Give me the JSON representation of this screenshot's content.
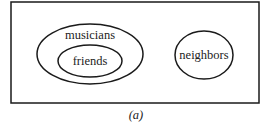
{
  "diagram": {
    "type": "venn-euler",
    "frame": {
      "x": 11,
      "y": 2,
      "width": 248,
      "height": 101,
      "stroke": "#1a1a1a"
    },
    "sets": [
      {
        "id": "musicians",
        "label": "musicians",
        "cx": 90,
        "cy": 54,
        "rx": 53,
        "ry": 30,
        "label_x": 90,
        "label_y": 39
      },
      {
        "id": "friends",
        "label": "friends",
        "cx": 90,
        "cy": 61,
        "rx": 32,
        "ry": 16,
        "label_x": 90,
        "label_y": 65,
        "subset_of": "musicians"
      },
      {
        "id": "neighbors",
        "label": "neighbors",
        "cx": 204,
        "cy": 55,
        "rx": 29,
        "ry": 24,
        "label_x": 204,
        "label_y": 59
      }
    ],
    "caption": "(a)"
  }
}
